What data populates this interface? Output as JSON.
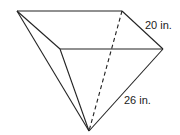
{
  "figure": {
    "type": "inverted square pyramid",
    "labels": {
      "base_edge": "20 in.",
      "slant_edge": "26 in."
    },
    "colors": {
      "stroke": "#222222",
      "background": "#ffffff"
    },
    "vertices": {
      "top_left": [
        17,
        11
      ],
      "top_right": [
        122,
        11
      ],
      "front_right": [
        163,
        49
      ],
      "front_left": [
        60,
        49
      ],
      "apex": [
        89,
        131
      ]
    }
  }
}
